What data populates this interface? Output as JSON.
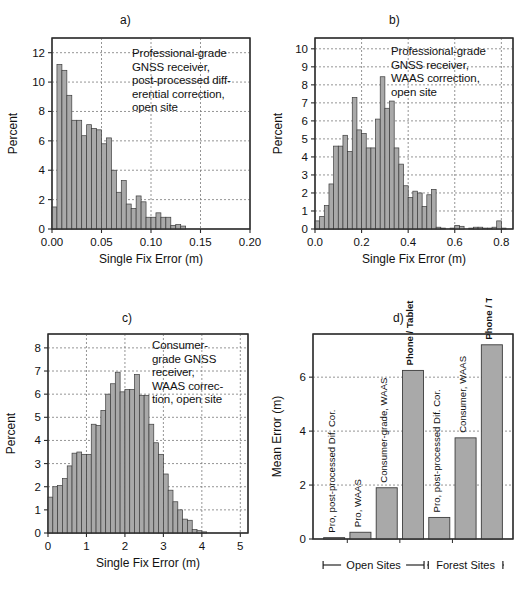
{
  "figure": {
    "panels": [
      {
        "id": "a",
        "label": "a)",
        "annotation": "Professional-grade\nGNSS receiver,\npost-processed diff-\nerential correction,\nopen site"
      },
      {
        "id": "b",
        "label": "b)",
        "annotation": "Professional-grade\nGNSS receiver,\nWAAS correction,\nopen site"
      },
      {
        "id": "c",
        "label": "c)",
        "annotation": "Consumer-\ngrade GNSS\nreceiver,\nWAAS correc-\ntion, open site"
      },
      {
        "id": "d",
        "label": "d)",
        "annotation": ""
      }
    ],
    "style": {
      "bar_fill": "#a9a9a9",
      "bar_stroke": "#3c3c3c",
      "axis_color": "#2b2b2b",
      "grid_color": "#7a7a7a"
    }
  },
  "chart_data": [
    {
      "type": "bar",
      "panel": "a",
      "title": "a)",
      "xlabel": "Single Fix Error (m)",
      "ylabel": "Percent",
      "xlim": [
        0.0,
        0.2
      ],
      "ylim": [
        0,
        13
      ],
      "xticks": [
        0.0,
        0.05,
        0.1,
        0.15,
        0.2
      ],
      "xticklabels": [
        "0.00",
        "0.05",
        "0.10",
        "0.15",
        "0.20"
      ],
      "yticks": [
        0,
        2,
        4,
        6,
        8,
        10,
        12
      ],
      "yticklabels": [
        "0",
        "2",
        "4",
        "6",
        "8",
        "10",
        "12"
      ],
      "grid": true,
      "bin_width": 0.005,
      "bin_starts": [
        0.0,
        0.005,
        0.01,
        0.015,
        0.02,
        0.025,
        0.03,
        0.035,
        0.04,
        0.045,
        0.05,
        0.055,
        0.06,
        0.065,
        0.07,
        0.075,
        0.08,
        0.085,
        0.09,
        0.095,
        0.1,
        0.105,
        0.11,
        0.115,
        0.12,
        0.125,
        0.13,
        0.135,
        0.14,
        0.145,
        0.15,
        0.155,
        0.16,
        0.165,
        0.17,
        0.175,
        0.18,
        0.185,
        0.19,
        0.195
      ],
      "values": [
        1.5,
        11.2,
        10.8,
        9.1,
        7.4,
        7.4,
        6.35,
        7.1,
        6.85,
        6.75,
        5.8,
        6.2,
        4.0,
        2.5,
        3.3,
        1.7,
        1.4,
        2.25,
        1.85,
        0.8,
        0.8,
        1.1,
        0.8,
        0.8,
        0.25,
        0.3,
        0.2,
        0.0,
        0.0,
        0.0,
        0.0,
        0.0,
        0.0,
        0.0,
        0.0,
        0.0,
        0.0,
        0.0,
        0.0,
        0.0
      ]
    },
    {
      "type": "bar",
      "panel": "b",
      "title": "b)",
      "xlabel": "Single Fix Error (m)",
      "ylabel": "Percent",
      "xlim": [
        0.0,
        0.85
      ],
      "ylim": [
        0,
        10.6
      ],
      "xticks": [
        0.0,
        0.2,
        0.4,
        0.6,
        0.8
      ],
      "xticklabels": [
        "0.0",
        "0.2",
        "0.4",
        "0.6",
        "0.8"
      ],
      "yticks": [
        0,
        1,
        2,
        3,
        4,
        5,
        6,
        7,
        8,
        9,
        10
      ],
      "yticklabels": [
        "0",
        "1",
        "2",
        "3",
        "4",
        "5",
        "6",
        "7",
        "8",
        "9",
        "10"
      ],
      "grid": true,
      "bin_width": 0.02,
      "bin_starts": [
        0.0,
        0.02,
        0.04,
        0.06,
        0.08,
        0.1,
        0.12,
        0.14,
        0.16,
        0.18,
        0.2,
        0.22,
        0.24,
        0.26,
        0.28,
        0.3,
        0.32,
        0.34,
        0.36,
        0.38,
        0.4,
        0.42,
        0.44,
        0.46,
        0.48,
        0.5,
        0.52,
        0.54,
        0.56,
        0.58,
        0.6,
        0.62,
        0.64,
        0.66,
        0.68,
        0.7,
        0.72,
        0.74,
        0.76,
        0.78,
        0.8,
        0.82
      ],
      "values": [
        0.45,
        0.7,
        1.3,
        2.5,
        4.6,
        4.6,
        5.2,
        4.3,
        7.3,
        5.5,
        5.3,
        4.5,
        4.5,
        6.1,
        8.45,
        6.7,
        7.1,
        4.5,
        3.6,
        2.4,
        1.75,
        2.1,
        2.0,
        1.25,
        1.9,
        2.2,
        0.1,
        0.05,
        0.0,
        0.05,
        0.2,
        0.15,
        0.0,
        0.05,
        0.1,
        0.1,
        0.05,
        0.05,
        0.1,
        0.45,
        0.05,
        0.0
      ]
    },
    {
      "type": "bar",
      "panel": "c",
      "title": "c)",
      "xlabel": "Single Fix Error (m)",
      "ylabel": "Percent",
      "xlim": [
        0.0,
        5.2
      ],
      "ylim": [
        0,
        8.6
      ],
      "xticks": [
        0,
        1,
        2,
        3,
        4,
        5
      ],
      "xticklabels": [
        "0",
        "1",
        "2",
        "3",
        "4",
        "5"
      ],
      "yticks": [
        0,
        1,
        2,
        3,
        4,
        5,
        6,
        7,
        8
      ],
      "yticklabels": [
        "0",
        "1",
        "2",
        "3",
        "4",
        "5",
        "6",
        "7",
        "8"
      ],
      "grid": true,
      "bin_width": 0.125,
      "bin_starts": [
        0.0,
        0.125,
        0.25,
        0.375,
        0.5,
        0.625,
        0.75,
        0.875,
        1.0,
        1.125,
        1.25,
        1.375,
        1.5,
        1.625,
        1.75,
        1.875,
        2.0,
        2.125,
        2.25,
        2.375,
        2.5,
        2.625,
        2.75,
        2.875,
        3.0,
        3.125,
        3.25,
        3.375,
        3.5,
        3.625,
        3.75,
        3.875,
        4.0,
        4.125,
        4.25,
        4.375,
        4.5,
        4.625,
        4.75,
        4.875
      ],
      "values": [
        1.55,
        2.0,
        2.05,
        2.35,
        2.9,
        3.45,
        3.5,
        3.4,
        3.4,
        4.7,
        4.65,
        5.3,
        6.0,
        6.45,
        6.95,
        6.1,
        6.2,
        6.2,
        6.85,
        5.95,
        5.95,
        4.7,
        3.9,
        3.4,
        2.55,
        1.85,
        1.35,
        1.0,
        0.6,
        0.55,
        0.15,
        0.1,
        0.05,
        0.0,
        0.0,
        0.0,
        0.0,
        0.0,
        0.0,
        0.0
      ]
    },
    {
      "type": "bar",
      "panel": "d",
      "title": "d)",
      "xlabel": "",
      "ylabel": "Mean Error (m)",
      "ylim": [
        0,
        7.6
      ],
      "yticks": [
        0,
        2,
        4,
        6
      ],
      "yticklabels": [
        "0",
        "2",
        "4",
        "6"
      ],
      "grid": true,
      "categories": [
        "Pro, post-processed Dif. Cor.",
        "Pro, WAAS",
        "Consumer-grade, WAAS",
        "Phone / Tablet GPS",
        "Pro, post-processed Dif. Cor.",
        "Consumer, WAAS",
        "Phone / Tablet GPS"
      ],
      "values": [
        0.05,
        0.25,
        1.9,
        6.25,
        0.8,
        3.75,
        7.2
      ],
      "label_bold": [
        false,
        false,
        false,
        true,
        false,
        false,
        true
      ],
      "groups": [
        {
          "label": "Open Sites",
          "start_index": 0,
          "end_index": 3
        },
        {
          "label": "Forest Sites",
          "start_index": 4,
          "end_index": 6
        }
      ]
    }
  ]
}
